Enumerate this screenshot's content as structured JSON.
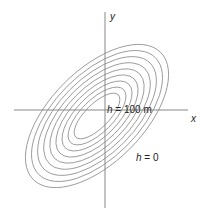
{
  "diagram": {
    "type": "contour-map",
    "axes": {
      "x_label": "x",
      "y_label": "y",
      "color": "#888888"
    },
    "contours": {
      "count": 9,
      "color": "#8a8a8a",
      "tilt_degrees": -45,
      "center": [
        97,
        116
      ]
    },
    "labels": {
      "top": {
        "var": "h",
        "rest": " = 100 m"
      },
      "bottom": {
        "var": "h",
        "rest": " = 0"
      }
    }
  }
}
